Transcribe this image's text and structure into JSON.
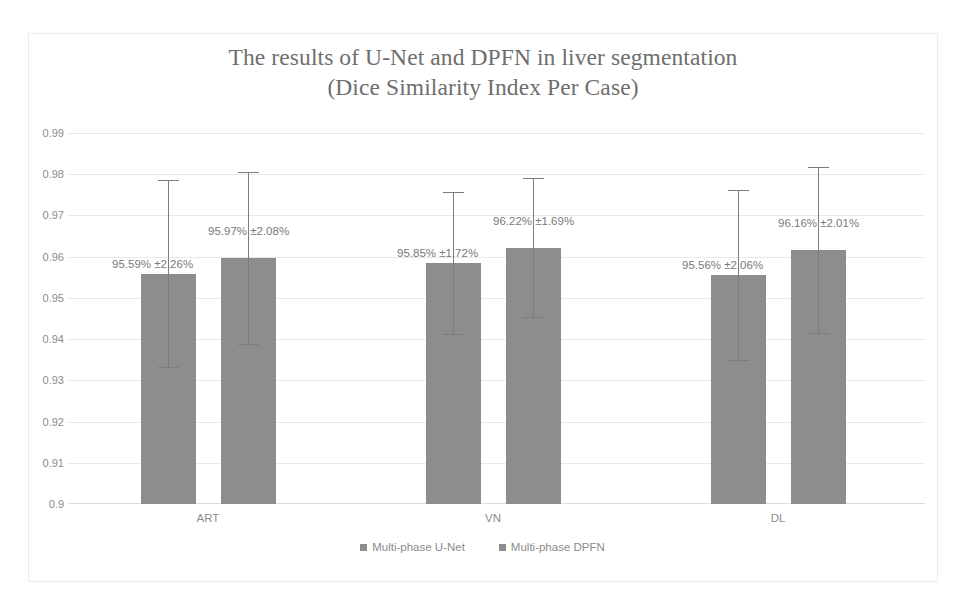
{
  "chart_data": {
    "type": "bar",
    "title": "The results of U-Net and DPFN in liver segmentation (Dice Similarity Index Per Case)",
    "title_line1": "The results of U-Net and DPFN in liver segmentation",
    "title_line2": "(Dice Similarity Index Per Case)",
    "xlabel": "",
    "ylabel": "",
    "ylim": [
      0.9,
      0.99
    ],
    "ytick_labels": [
      "0.99",
      "0.98",
      "0.97",
      "0.96",
      "0.95",
      "0.94",
      "0.93",
      "0.92",
      "0.91",
      "0.9"
    ],
    "ytick_values": [
      0.99,
      0.98,
      0.97,
      0.96,
      0.95,
      0.94,
      0.93,
      0.92,
      0.91,
      0.9
    ],
    "grid": true,
    "legend_position": "bottom",
    "bar_color": "#8d8d8e",
    "error_bar_color": "#7d7d7e",
    "categories": [
      "ART",
      "VN",
      "DL"
    ],
    "series": [
      {
        "name": "Multi-phase U-Net",
        "values": [
          0.9559,
          0.9585,
          0.9556
        ],
        "errors": [
          0.0226,
          0.0172,
          0.0206
        ],
        "labels": [
          "95.59% ±2.26%",
          "95.85% ±1.72%",
          "95.56% ±2.06%"
        ]
      },
      {
        "name": "Multi-phase DPFN",
        "values": [
          0.9597,
          0.9622,
          0.9616
        ],
        "errors": [
          0.0208,
          0.0169,
          0.0201
        ],
        "labels": [
          "95.97% ±2.08%",
          "96.22% ±1.69%",
          "96.16% ±2.01%"
        ]
      }
    ]
  },
  "ylabels": {
    "t0": "0.99",
    "t1": "0.98",
    "t2": "0.97",
    "t3": "0.96",
    "t4": "0.95",
    "t5": "0.94",
    "t6": "0.93",
    "t7": "0.92",
    "t8": "0.91",
    "t9": "0.9"
  },
  "xlabels": {
    "c0": "ART",
    "c1": "VN",
    "c2": "DL"
  },
  "datalabels": {
    "g0s0": "95.59% ±2.26%",
    "g0s1": "95.97% ±2.08%",
    "g1s0": "95.85% ±1.72%",
    "g1s1": "96.22% ±1.69%",
    "g2s0": "95.56% ±2.06%",
    "g2s1": "96.16% ±2.01%"
  },
  "legend": {
    "item0": "Multi-phase U-Net",
    "item1": "Multi-phase DPFN"
  }
}
